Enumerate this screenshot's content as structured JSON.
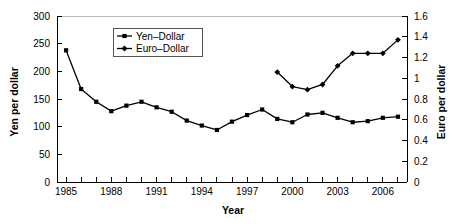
{
  "chart_data": {
    "type": "line",
    "title": "",
    "xlabel": "Year",
    "ylabel": "Yen per dollar",
    "y2label": "Euro per dollar",
    "grid": false,
    "legend_position": "top-center-left",
    "xlim": [
      1984.4,
      2007.6
    ],
    "ylim": [
      0,
      300
    ],
    "y2lim": [
      0,
      1.6
    ],
    "x_tick_values": [
      1985,
      1986,
      1987,
      1988,
      1989,
      1990,
      1991,
      1992,
      1993,
      1994,
      1995,
      1996,
      1997,
      1998,
      1999,
      2000,
      2001,
      2002,
      2003,
      2004,
      2005,
      2006,
      2007
    ],
    "x_tick_labels": [
      "1985",
      "",
      "",
      "1988",
      "",
      "",
      "1991",
      "",
      "",
      "1994",
      "",
      "",
      "1997",
      "",
      "",
      "2000",
      "",
      "",
      "2003",
      "",
      "",
      "2006",
      ""
    ],
    "y_tick_values": [
      0,
      50,
      100,
      150,
      200,
      250,
      300
    ],
    "y_tick_labels": [
      "0",
      "50",
      "100",
      "150",
      "200",
      "250",
      "300"
    ],
    "y2_tick_values": [
      0,
      0.2,
      0.4,
      0.6,
      0.8,
      1.0,
      1.2,
      1.4,
      1.6
    ],
    "y2_tick_labels": [
      "0",
      "0.2",
      "0.4",
      "0.6",
      "0.8",
      "1",
      "1.2",
      "1.4",
      "1.6"
    ],
    "series": [
      {
        "name": "Yen–Dollar",
        "axis": "left",
        "marker": "square",
        "color": "#000000",
        "x": [
          1985,
          1986,
          1987,
          1988,
          1989,
          1990,
          1991,
          1992,
          1993,
          1994,
          1995,
          1996,
          1997,
          1998,
          1999,
          2000,
          2001,
          2002,
          2003,
          2004,
          2005,
          2006,
          2007
        ],
        "values": [
          238,
          168,
          145,
          128,
          138,
          145,
          135,
          127,
          111,
          102,
          94,
          109,
          121,
          131,
          114,
          108,
          122,
          125,
          116,
          108,
          110,
          116,
          118
        ]
      },
      {
        "name": "Euro–Dollar",
        "axis": "right",
        "marker": "diamond",
        "color": "#000000",
        "x": [
          1999,
          2000,
          2001,
          2002,
          2003,
          2004,
          2005,
          2006,
          2007
        ],
        "values": [
          1.06,
          0.92,
          0.89,
          0.94,
          1.12,
          1.24,
          1.24,
          1.24,
          1.37
        ]
      }
    ]
  },
  "legend": {
    "entries": [
      {
        "label": "Yen–Dollar",
        "marker": "square"
      },
      {
        "label": "Euro–Dollar",
        "marker": "diamond"
      }
    ]
  },
  "axes": {
    "left_title": "Yen per dollar",
    "right_title": "Euro per dollar",
    "bottom_title": "Year"
  }
}
